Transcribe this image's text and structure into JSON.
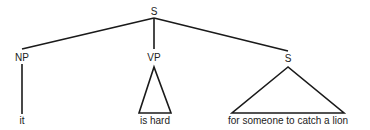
{
  "diagram": {
    "type": "syntax-tree",
    "root": {
      "label": "S",
      "children": [
        {
          "label": "NP",
          "branch": "line",
          "terminal": "it"
        },
        {
          "label": "VP",
          "branch": "triangle",
          "terminal": "is hard"
        },
        {
          "label": "S",
          "branch": "triangle",
          "terminal": "for someone to catch a lion"
        }
      ]
    }
  }
}
